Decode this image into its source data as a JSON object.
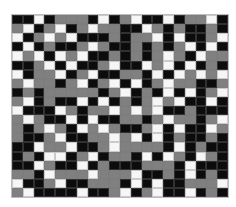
{
  "grid": {
    "cols": 20,
    "rows": 20,
    "legend": {
      "B": "black",
      "G": "gray",
      "W": "white"
    },
    "colors": {
      "B": "#0c0c0c",
      "G": "#808080",
      "W": "#f6f6f6"
    },
    "cells": [
      "BBWBGGGBWBGWBBWBGGWB",
      "GWBGWBGWGGBBWGBGBBGB",
      "WBGWGWBBBGBGGWBWBBGW",
      "BWBGBBGWGBBGBGBGWBWB",
      "WGWBWGWBBGBGBGWGBWGG",
      "BBGWBWBBGWBBWGWBWBGB",
      "WBGGWBGWBBGGBWBWGWGW",
      "GWGGBGWBGWBWBGWGGBBG",
      "BGBGGGGGBGWBGBWBWBGW",
      "GWBGBBWBWBGBGWGWBBWB",
      "WBBBWGBGGWGWGWBBGBBB",
      "GWGBBWBWBBGGBGWGGBGW",
      "GBGWGBWGWGBBGWBWBBWG",
      "GBBGWBBGGWGWBWBGBBGB",
      "BBWGGWBBGWGGGGBWBGBB",
      "BGBWWBGWBGGBWBWGBWGB",
      "BBWGBBWBGBBBGGGBWBBB",
      "GGBWGGGWGGGWBBGBWBGB",
      "WBBGWBBGGGBWBWBBGGGW",
      "GWBBBBWBBGWBGWBBWBGB"
    ]
  }
}
